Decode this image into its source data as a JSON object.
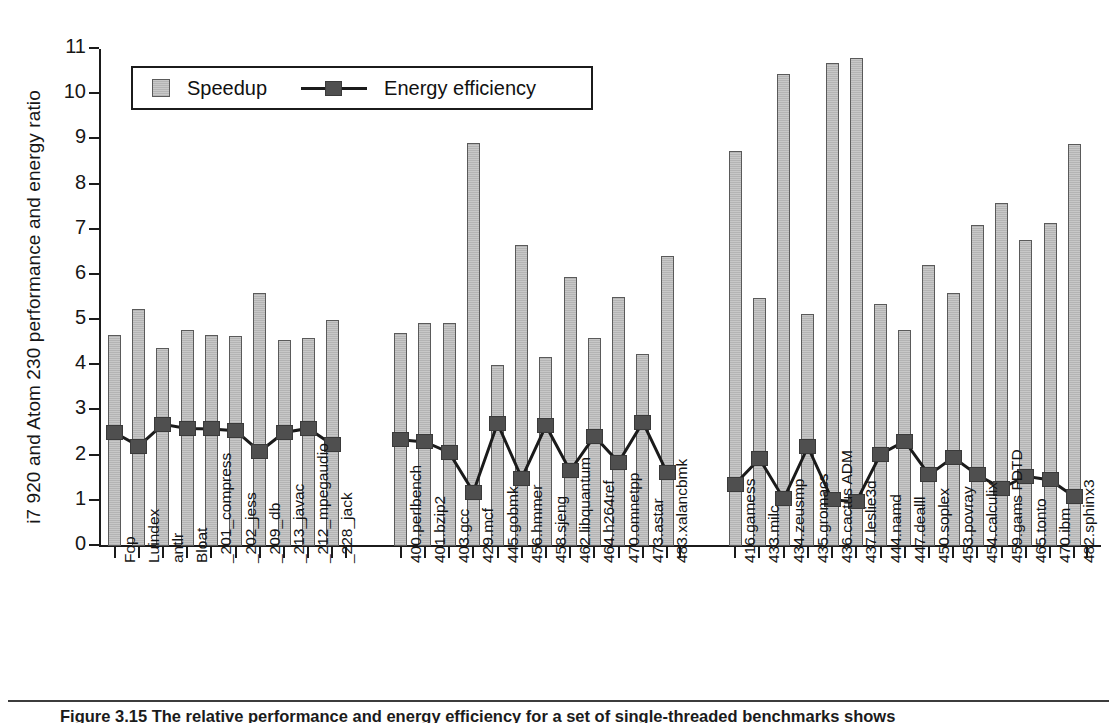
{
  "figure": {
    "caption": "Figure 3.15 The relative performance and energy efficiency for a set of single-threaded benchmarks shows"
  },
  "legend": {
    "position": "top-left-inside",
    "items": [
      {
        "key": "speedup",
        "label": "Speedup",
        "marker": "bar-swatch",
        "color": "#c8c8c8"
      },
      {
        "key": "energy",
        "label": "Energy efficiency",
        "marker": "line-square",
        "color": "#4f4f4f"
      }
    ]
  },
  "axes": {
    "ylabel": "i7 920 and Atom 230 performance and energy ratio",
    "yticks": [
      0,
      1,
      2,
      3,
      4,
      5,
      6,
      7,
      8,
      9,
      10,
      11
    ],
    "ylim": [
      0,
      11
    ],
    "xlabel": ""
  },
  "chart_data": {
    "type": "bar",
    "title": "",
    "xlabel": "",
    "ylabel": "i7 920 and Atom 230 performance and energy ratio",
    "ylim": [
      0,
      11
    ],
    "grid": false,
    "legend_position": "upper left",
    "categories": [
      "Fop",
      "Luindex",
      "antlr",
      "Bloat",
      "_201_compress",
      "_202_jess",
      "_209_db",
      "_213_javac",
      "_212_mpegaudio",
      "_228_jack",
      "400.perlbench",
      "401.bzip2",
      "403.gcc",
      "429.mcf",
      "445.gobmk",
      "456.hmmer",
      "458.sjeng",
      "462.libquantum",
      "464.h264ref",
      "470.omnetpp",
      "473.astar",
      "483.xalancbmk",
      "416.gamess",
      "433.milc",
      "434.zeusmp",
      "435.gromacs",
      "436.cactus ADM",
      "437.leslie3d",
      "444.namd",
      "447.dealll",
      "450.soplex",
      "453.povray",
      "454.calculix",
      "459.gams FDTD",
      "465.tonto",
      "470.ibm",
      "482.sphinx3"
    ],
    "groups": [
      {
        "name": "DaCapo / SPECjvm",
        "start": 0,
        "end": 9
      },
      {
        "name": "SPECINT2006",
        "start": 10,
        "end": 21
      },
      {
        "name": "SPECFP2006",
        "start": 22,
        "end": 36
      }
    ],
    "series": [
      {
        "name": "Speedup",
        "type": "bar",
        "color": "#c8c8c8",
        "values": [
          4.67,
          5.24,
          4.38,
          4.79,
          4.67,
          4.65,
          5.6,
          4.56,
          4.61,
          5.0,
          4.71,
          4.94,
          4.94,
          8.91,
          4.01,
          6.66,
          4.18,
          5.95,
          4.6,
          5.52,
          4.25,
          6.42,
          8.74,
          5.5,
          10.44,
          5.13,
          10.7,
          10.8,
          5.35,
          4.79,
          6.22,
          5.61,
          7.1,
          7.59,
          6.78,
          7.16,
          8.9
        ]
      },
      {
        "name": "Energy efficiency",
        "type": "line",
        "color": "#4f4f4f",
        "values": [
          2.49,
          2.19,
          2.67,
          2.58,
          2.57,
          2.53,
          2.07,
          2.49,
          2.58,
          2.22,
          2.33,
          2.28,
          2.05,
          1.17,
          2.69,
          1.48,
          2.64,
          1.64,
          2.41,
          1.83,
          2.72,
          1.6,
          1.35,
          1.91,
          1.02,
          2.17,
          1.0,
          0.96,
          2.01,
          2.3,
          1.55,
          1.94,
          1.55,
          1.26,
          1.52,
          1.44,
          1.07
        ]
      }
    ]
  }
}
